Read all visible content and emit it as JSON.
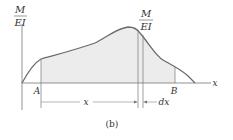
{
  "figure": {
    "caption": "(b)",
    "y_axis_label": {
      "numerator": "M",
      "denominator": "EI"
    },
    "strip_label": {
      "numerator": "M",
      "denominator": "EI"
    },
    "x_axis_label": "x",
    "point_a": "A",
    "point_b": "B",
    "distance_label": "x",
    "strip_width_label": "dx",
    "colors": {
      "curve": "#6b6b6b",
      "fill": "#ececec",
      "axis": "#777777",
      "text": "#333333"
    }
  }
}
